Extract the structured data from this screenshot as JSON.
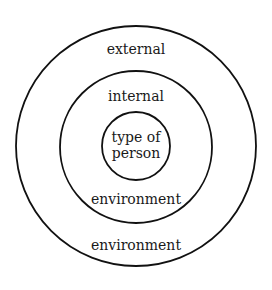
{
  "diagram": {
    "type": "concentric-circles",
    "rings": [
      {
        "id": "outer",
        "label_top": "external",
        "label_bottom": "environment",
        "full_label": "external environment"
      },
      {
        "id": "middle",
        "label_top": "internal",
        "label_bottom": "environment",
        "full_label": "internal environment"
      },
      {
        "id": "inner",
        "label_line1": "type of",
        "label_line2": "person",
        "full_label": "type of person"
      }
    ],
    "stroke_color": "#111111",
    "background": "#ffffff"
  }
}
